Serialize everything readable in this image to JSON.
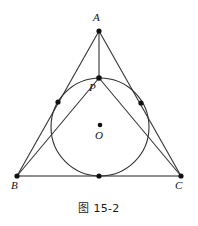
{
  "figure": {
    "caption": "图 15-2",
    "canvas": {
      "width": 198,
      "height": 226
    },
    "colors": {
      "stroke": "#3a3a3a",
      "base_stroke": "#6b6b6b",
      "circle_stroke": "#2f2f2f",
      "point_fill": "#111111",
      "label_color": "#111111",
      "background": "#ffffff"
    },
    "labels": {
      "A": "A",
      "B": "B",
      "C": "C",
      "O": "O",
      "P": "P"
    },
    "points": {
      "A": {
        "x": 99,
        "y": 31
      },
      "B": {
        "x": 17,
        "y": 176
      },
      "C": {
        "x": 181,
        "y": 176
      },
      "O": {
        "x": 100,
        "y": 125
      },
      "P": {
        "x": 99,
        "y": 78
      },
      "tangent_left": {
        "x": 58,
        "y": 102
      },
      "tangent_right": {
        "x": 141,
        "y": 103
      },
      "tangent_bottom": {
        "x": 99,
        "y": 176
      }
    },
    "circle": {
      "cx": 100,
      "cy": 127,
      "r": 49
    },
    "label_positions": {
      "A": {
        "x": 93,
        "y": 12
      },
      "B": {
        "x": 11,
        "y": 180
      },
      "C": {
        "x": 175,
        "y": 180
      },
      "O": {
        "x": 95,
        "y": 130
      },
      "P": {
        "x": 89,
        "y": 82
      }
    },
    "segments": [
      {
        "name": "side-AB",
        "from": "A",
        "to": "B"
      },
      {
        "name": "side-AC",
        "from": "A",
        "to": "C"
      },
      {
        "name": "side-BC",
        "from": "B",
        "to": "C"
      },
      {
        "name": "cevian-AP",
        "from": "A",
        "to": "P"
      },
      {
        "name": "cevian-BP",
        "from": "B",
        "to": "P"
      },
      {
        "name": "cevian-CP",
        "from": "C",
        "to": "P"
      }
    ]
  }
}
